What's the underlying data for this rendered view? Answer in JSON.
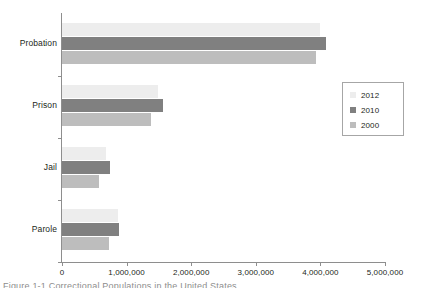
{
  "chart_data": {
    "type": "bar",
    "orientation": "horizontal",
    "title": "",
    "xlabel": "",
    "ylabel": "",
    "categories": [
      "Probation",
      "Prison",
      "Jail",
      "Parole"
    ],
    "series": [
      {
        "name": "2012",
        "color": "#ededed",
        "values": [
          3990000,
          1490000,
          680000,
          860000
        ]
      },
      {
        "name": "2010",
        "color": "#808080",
        "values": [
          4090000,
          1560000,
          740000,
          880000
        ]
      },
      {
        "name": "2000",
        "color": "#bdbdbd",
        "values": [
          3930000,
          1380000,
          570000,
          730000
        ]
      }
    ],
    "series_draw_order": [
      "2012",
      "2010",
      "2000"
    ],
    "xlim": [
      0,
      5000000
    ],
    "xticks": [
      0,
      1000000,
      2000000,
      3000000,
      4000000,
      5000000
    ],
    "xtick_labels": [
      "0",
      "1,000,000",
      "2,000,000",
      "3,000,000",
      "4,000,000",
      "5,000,000"
    ],
    "grid": false,
    "legend_position": "right",
    "legend_entries": [
      "2012",
      "2010",
      "2000"
    ]
  },
  "axes": {
    "x_tick_labels": [
      "0",
      "1,000,000",
      "2,000,000",
      "3,000,000",
      "4,000,000",
      "5,000,000"
    ],
    "category_labels": [
      "Probation",
      "Prison",
      "Jail",
      "Parole"
    ]
  },
  "legend": {
    "items": [
      {
        "label": "2012",
        "color": "#ededed"
      },
      {
        "label": "2010",
        "color": "#808080"
      },
      {
        "label": "2000",
        "color": "#bdbdbd"
      }
    ]
  },
  "caption": {
    "partial_text": "Figure 1-1  Correctional Populations in the United States"
  },
  "colors": {
    "axis": "#8e8e8e",
    "text": "#231f20",
    "series_2012": "#ededed",
    "series_2010": "#808080",
    "series_2000": "#bdbdbd",
    "background": "#ffffff"
  }
}
